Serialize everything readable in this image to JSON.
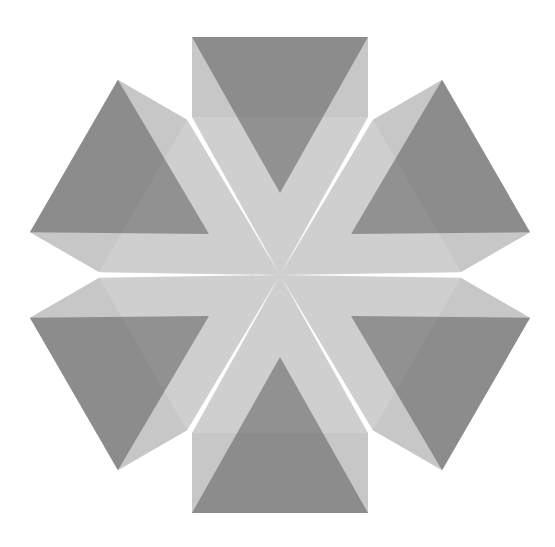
{
  "figure": {
    "symmetry": 6,
    "rotations_deg": [
      0,
      60,
      120,
      180,
      240,
      300
    ],
    "colors": {
      "background": "#ffffff",
      "square_fill": "#bdbdbd",
      "triangle_fill": "#9a9a9a",
      "core_fill": "#a8a8a8",
      "outline": "#6f6f6f"
    }
  }
}
